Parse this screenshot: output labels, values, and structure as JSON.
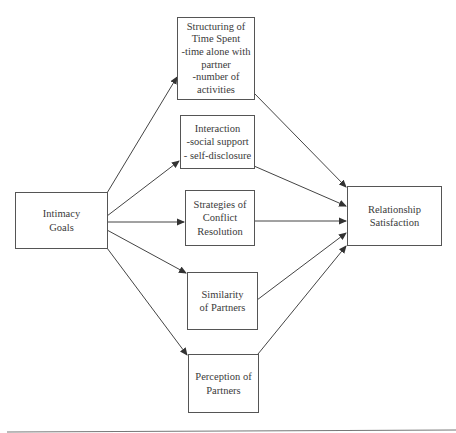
{
  "diagram": {
    "type": "path-model",
    "source": {
      "id": "intimacy-goals",
      "lines": [
        "Intimacy",
        "Goals"
      ]
    },
    "mediators": [
      {
        "id": "structuring-time",
        "lines": [
          "Structuring of",
          "Time Spent",
          "-time alone with",
          "partner",
          "-number of",
          "activities"
        ]
      },
      {
        "id": "interaction",
        "lines": [
          "Interaction",
          "-social support",
          "- self-disclosure"
        ]
      },
      {
        "id": "conflict-strategies",
        "lines": [
          "Strategies of",
          "Conflict",
          "Resolution"
        ]
      },
      {
        "id": "similarity",
        "lines": [
          "Similarity",
          "of Partners"
        ]
      },
      {
        "id": "perception",
        "lines": [
          "Perception of",
          "Partners"
        ]
      }
    ],
    "outcome": {
      "id": "relationship-satisfaction",
      "lines": [
        "Relationship",
        "Satisfaction"
      ]
    },
    "edges": [
      [
        "intimacy-goals",
        "structuring-time"
      ],
      [
        "intimacy-goals",
        "interaction"
      ],
      [
        "intimacy-goals",
        "conflict-strategies"
      ],
      [
        "intimacy-goals",
        "similarity"
      ],
      [
        "intimacy-goals",
        "perception"
      ],
      [
        "structuring-time",
        "relationship-satisfaction"
      ],
      [
        "interaction",
        "relationship-satisfaction"
      ],
      [
        "conflict-strategies",
        "relationship-satisfaction"
      ],
      [
        "similarity",
        "relationship-satisfaction"
      ],
      [
        "perception",
        "relationship-satisfaction"
      ]
    ],
    "colors": {
      "line": "#444444",
      "border": "#555555",
      "text": "#3a3a3a"
    }
  }
}
